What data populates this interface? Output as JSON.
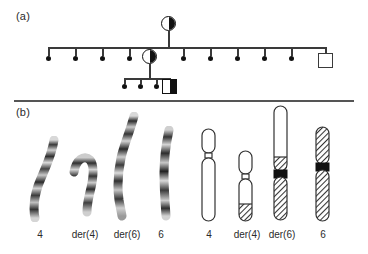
{
  "figure": {
    "panels": [
      {
        "id": "a",
        "label": "(a)"
      },
      {
        "id": "b",
        "label": "(b)"
      }
    ]
  },
  "panel_a": {
    "label": "(a)",
    "description": "Three-generation pedigree",
    "symbols": {
      "circle_half_filled": "circle-half-filled",
      "square_open": "square-open",
      "square_half_filled": "square-half-filled",
      "dot": "small-filled-dot"
    },
    "generation_i": {
      "proposita": {
        "symbol": "circle-half-filled",
        "x": 169,
        "y": 24
      }
    },
    "generation_ii": {
      "sibship_line_y": 47,
      "dots_left": [
        48,
        75,
        102,
        129
      ],
      "carrier": {
        "symbol": "circle-half-filled",
        "x": 149,
        "y": 56
      },
      "dots_right": [
        183,
        210,
        237,
        264,
        291
      ],
      "unaffected_male": {
        "symbol": "square-open",
        "x": 325,
        "y": 60
      }
    },
    "generation_iii": {
      "sibship_line_y": 78,
      "dots": [
        124,
        140,
        156
      ],
      "proband": {
        "symbol": "square-half-filled",
        "x": 169,
        "y": 85
      }
    }
  },
  "panel_b": {
    "label": "(b)",
    "description": "Partial karyotype and ideograms of the t(4;6) translocation",
    "gbanded_group": {
      "caption": "G-banded chromosomes",
      "labels": [
        "4",
        "der(4)",
        "der(6)",
        "6"
      ]
    },
    "ideogram_group": {
      "caption": "Schematic ideograms",
      "labels": [
        "4",
        "der(4)",
        "der(6)",
        "6"
      ],
      "legend": {
        "white": "chromosome 4 material",
        "hatched": "chromosome 6 material",
        "black": "centromere"
      }
    },
    "colors": {
      "outline": "#333333",
      "centromere": "#111111",
      "white_fill": "#ffffff",
      "hatch_stroke": "#333333"
    }
  }
}
